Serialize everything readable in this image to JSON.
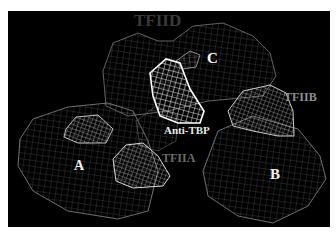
{
  "figure": {
    "background_color": "#000000",
    "wire_color": "#9a9a9a",
    "highlight_color": "#ffffff",
    "labels": {
      "tfiid": "TFIID",
      "c": "C",
      "tfiib": "TFIIB",
      "anti_tbp": "Anti-TBP",
      "tfiia": "TFIIA",
      "a": "A",
      "b": "B"
    }
  }
}
